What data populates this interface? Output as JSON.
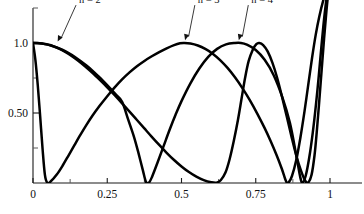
{
  "chart_data": {
    "type": "line",
    "title": "",
    "subtitle": "",
    "xlabel": "",
    "ylabel": "",
    "xlim": [
      0,
      1.035
    ],
    "ylim": [
      0,
      1.42
    ],
    "grid": false,
    "legend_position": "inline-annotations",
    "background": "#ffffff",
    "curve_color": "#000000",
    "axis_color": "#1b1b1b",
    "x_ticks_major": [
      0,
      0.25,
      0.5,
      0.75,
      1
    ],
    "x_tick_labels": [
      "0",
      "0.25",
      "0.5",
      "0.75",
      "1"
    ],
    "x_ticks_minor": [
      0.125,
      0.375,
      0.625,
      0.875
    ],
    "y_ticks_major": [
      0.5,
      1.0
    ],
    "y_tick_labels": [
      "0.50",
      "1.0"
    ],
    "y_ticks_minor": [
      0.25,
      0.75,
      1.25
    ],
    "annotations": [
      {
        "label": "n = 2",
        "text_x": 0.155,
        "text_y": 1.285,
        "point_x": 0.083,
        "point_y": 1.01
      },
      {
        "label": "n = 3",
        "text_x": 0.555,
        "text_y": 1.285,
        "point_x": 0.512,
        "point_y": 1.02
      },
      {
        "label": "n = 4",
        "text_x": 0.735,
        "text_y": 1.285,
        "point_x": 0.693,
        "point_y": 1.02
      }
    ],
    "series": [
      {
        "name": "n = 2",
        "label": "n = 2",
        "description": "starts at 1.0, decays to zero near x=0.38, rises to a peak of 1.0 at x=0.70, falls to zero near x=0.90, then rises steeply past the top of the frame at x=1",
        "points": [
          [
            0.0,
            1.0
          ],
          [
            0.02,
            0.998
          ],
          [
            0.04,
            0.992
          ],
          [
            0.06,
            0.982
          ],
          [
            0.08,
            0.968
          ],
          [
            0.1,
            0.95
          ],
          [
            0.12,
            0.928
          ],
          [
            0.14,
            0.902
          ],
          [
            0.16,
            0.872
          ],
          [
            0.18,
            0.839
          ],
          [
            0.2,
            0.803
          ],
          [
            0.22,
            0.763
          ],
          [
            0.24,
            0.721
          ],
          [
            0.26,
            0.676
          ],
          [
            0.28,
            0.629
          ],
          [
            0.3,
            0.58
          ],
          [
            0.32,
            0.456
          ],
          [
            0.34,
            0.33
          ],
          [
            0.355,
            0.215
          ],
          [
            0.37,
            0.09
          ],
          [
            0.38,
            0.01
          ],
          [
            0.39,
            0.002
          ],
          [
            0.4,
            0.04
          ],
          [
            0.42,
            0.15
          ],
          [
            0.44,
            0.265
          ],
          [
            0.46,
            0.38
          ],
          [
            0.48,
            0.487
          ],
          [
            0.5,
            0.585
          ],
          [
            0.53,
            0.712
          ],
          [
            0.56,
            0.818
          ],
          [
            0.59,
            0.901
          ],
          [
            0.62,
            0.958
          ],
          [
            0.65,
            0.99
          ],
          [
            0.68,
            1.0
          ],
          [
            0.7,
            1.0
          ],
          [
            0.72,
            0.988
          ],
          [
            0.75,
            0.95
          ],
          [
            0.78,
            0.88
          ],
          [
            0.81,
            0.772
          ],
          [
            0.84,
            0.61
          ],
          [
            0.865,
            0.43
          ],
          [
            0.885,
            0.215
          ],
          [
            0.9,
            0.04
          ],
          [
            0.908,
            0.002
          ],
          [
            0.918,
            0.05
          ],
          [
            0.93,
            0.18
          ],
          [
            0.942,
            0.36
          ],
          [
            0.952,
            0.545
          ],
          [
            0.962,
            0.76
          ],
          [
            0.97,
            0.95
          ],
          [
            0.978,
            1.13
          ],
          [
            0.986,
            1.28
          ],
          [
            0.994,
            1.39
          ],
          [
            1.0,
            1.43
          ]
        ]
      },
      {
        "name": "n = 3",
        "label": "n = 3",
        "description": "starts at 1.0, decays to zero near x=0.04, rises to a peak of 1.0 at x=0.51, falls to zero near x=0.855, rises steeply past the top of the frame at x=1",
        "points": [
          [
            0.0,
            1.0
          ],
          [
            0.008,
            0.88
          ],
          [
            0.016,
            0.7
          ],
          [
            0.024,
            0.48
          ],
          [
            0.032,
            0.25
          ],
          [
            0.04,
            0.06
          ],
          [
            0.048,
            0.002
          ],
          [
            0.06,
            0.012
          ],
          [
            0.08,
            0.06
          ],
          [
            0.1,
            0.125
          ],
          [
            0.12,
            0.198
          ],
          [
            0.14,
            0.272
          ],
          [
            0.16,
            0.345
          ],
          [
            0.18,
            0.415
          ],
          [
            0.2,
            0.48
          ],
          [
            0.225,
            0.553
          ],
          [
            0.25,
            0.62
          ],
          [
            0.275,
            0.683
          ],
          [
            0.3,
            0.74
          ],
          [
            0.325,
            0.79
          ],
          [
            0.35,
            0.834
          ],
          [
            0.375,
            0.872
          ],
          [
            0.4,
            0.905
          ],
          [
            0.425,
            0.935
          ],
          [
            0.45,
            0.962
          ],
          [
            0.475,
            0.985
          ],
          [
            0.495,
            0.998
          ],
          [
            0.51,
            1.0
          ],
          [
            0.53,
            0.996
          ],
          [
            0.555,
            0.982
          ],
          [
            0.58,
            0.958
          ],
          [
            0.605,
            0.924
          ],
          [
            0.63,
            0.878
          ],
          [
            0.655,
            0.822
          ],
          [
            0.68,
            0.755
          ],
          [
            0.705,
            0.678
          ],
          [
            0.73,
            0.592
          ],
          [
            0.755,
            0.496
          ],
          [
            0.78,
            0.392
          ],
          [
            0.8,
            0.3
          ],
          [
            0.82,
            0.2
          ],
          [
            0.838,
            0.1
          ],
          [
            0.852,
            0.012
          ],
          [
            0.86,
            0.002
          ],
          [
            0.872,
            0.05
          ],
          [
            0.886,
            0.16
          ],
          [
            0.9,
            0.32
          ],
          [
            0.914,
            0.51
          ],
          [
            0.928,
            0.72
          ],
          [
            0.94,
            0.9
          ],
          [
            0.952,
            1.06
          ],
          [
            0.964,
            1.19
          ],
          [
            0.978,
            1.31
          ],
          [
            0.99,
            1.39
          ],
          [
            1.0,
            1.43
          ]
        ]
      },
      {
        "name": "n = 4",
        "label": "n = 4",
        "description": "starts at 1.0, stays high briefly then decays to zero near x=0.62, rises to a peak of 1.0 near x=0.50 region overlapped, falls toward zero near x=0.93, rises steeply past the top of the frame at x=1",
        "points": [
          [
            0.0,
            1.0
          ],
          [
            0.015,
            1.0
          ],
          [
            0.03,
            0.997
          ],
          [
            0.05,
            0.989
          ],
          [
            0.07,
            0.976
          ],
          [
            0.09,
            0.958
          ],
          [
            0.11,
            0.935
          ],
          [
            0.13,
            0.908
          ],
          [
            0.15,
            0.877
          ],
          [
            0.175,
            0.834
          ],
          [
            0.2,
            0.787
          ],
          [
            0.225,
            0.736
          ],
          [
            0.25,
            0.683
          ],
          [
            0.275,
            0.627
          ],
          [
            0.3,
            0.569
          ],
          [
            0.325,
            0.51
          ],
          [
            0.35,
            0.45
          ],
          [
            0.375,
            0.39
          ],
          [
            0.4,
            0.33
          ],
          [
            0.425,
            0.272
          ],
          [
            0.45,
            0.216
          ],
          [
            0.475,
            0.164
          ],
          [
            0.5,
            0.118
          ],
          [
            0.525,
            0.078
          ],
          [
            0.55,
            0.045
          ],
          [
            0.575,
            0.02
          ],
          [
            0.6,
            0.005
          ],
          [
            0.618,
            0.002
          ],
          [
            0.632,
            0.02
          ],
          [
            0.648,
            0.075
          ],
          [
            0.662,
            0.17
          ],
          [
            0.676,
            0.3
          ],
          [
            0.69,
            0.45
          ],
          [
            0.702,
            0.6
          ],
          [
            0.714,
            0.75
          ],
          [
            0.726,
            0.87
          ],
          [
            0.74,
            0.952
          ],
          [
            0.752,
            0.992
          ],
          [
            0.762,
            1.0
          ],
          [
            0.775,
            0.985
          ],
          [
            0.79,
            0.94
          ],
          [
            0.806,
            0.86
          ],
          [
            0.822,
            0.752
          ],
          [
            0.838,
            0.62
          ],
          [
            0.854,
            0.478
          ],
          [
            0.87,
            0.335
          ],
          [
            0.886,
            0.2
          ],
          [
            0.902,
            0.09
          ],
          [
            0.916,
            0.018
          ],
          [
            0.926,
            0.002
          ],
          [
            0.938,
            0.06
          ],
          [
            0.948,
            0.2
          ],
          [
            0.956,
            0.38
          ],
          [
            0.964,
            0.59
          ],
          [
            0.972,
            0.81
          ],
          [
            0.98,
            1.03
          ],
          [
            0.988,
            1.23
          ],
          [
            0.996,
            1.39
          ],
          [
            1.0,
            1.43
          ]
        ]
      }
    ]
  }
}
